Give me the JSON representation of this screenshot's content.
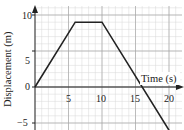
{
  "chart_data": {
    "type": "line",
    "title": "",
    "xlabel": "Time (s)",
    "ylabel": "Displacement (m)",
    "x": [
      0,
      6,
      10,
      20
    ],
    "series": [
      {
        "name": "displacement",
        "values": [
          0,
          9,
          9,
          -6
        ]
      }
    ],
    "xlim": [
      0,
      20
    ],
    "ylim": [
      -6,
      10
    ],
    "x_ticks": [
      "5",
      "10",
      "15",
      "20"
    ],
    "y_ticks": [
      "-5",
      "0",
      "5",
      "10"
    ],
    "grid": true,
    "legend": "none"
  },
  "labels": {
    "xlabel": "Time (s)",
    "ylabel": "Displacement (m)",
    "x_ticks": [
      "5",
      "10",
      "15",
      "20"
    ],
    "y_ticks": [
      "10",
      "5",
      "0",
      "−5"
    ]
  },
  "colors": {
    "grid_minor": "#d8d8d8",
    "grid_major": "#a8a8a8",
    "line": "#222222",
    "axis": "#222222"
  }
}
